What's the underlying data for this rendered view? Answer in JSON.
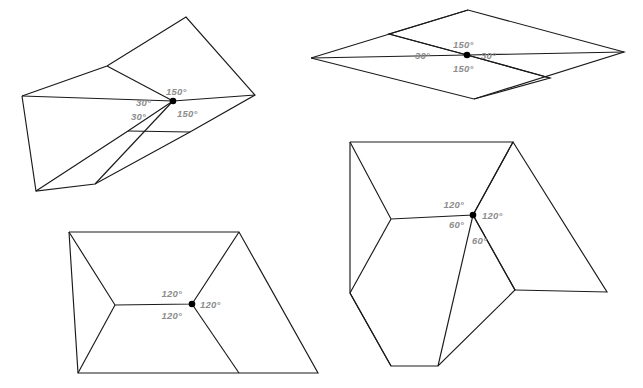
{
  "page": {
    "background_color": "#ffffff",
    "width": 643,
    "height": 388,
    "line_color": "#1a1a1a",
    "label_color": "#8d8d8d",
    "dot_color": "#000000"
  },
  "figures": [
    {
      "id": "figure-top-left",
      "name": "top-left-rhombus-tiling",
      "description": "Four rhombi meeting at a marked vertex, drawn as a folded zigzag band",
      "vertex": {
        "x": 173,
        "y": 101
      },
      "polylines": [
        "22,96 107,66 186,17 255,95 190,132 95,184 36,191 22,96",
        "22,96 173,101 255,95",
        "107,66 173,101",
        "95,184 173,101",
        "36,191 128,131 173,101",
        "190,132 128,131"
      ],
      "labels": [
        {
          "text": "150°",
          "x": 166,
          "y": 95,
          "anchor": "start",
          "name": "angle-label-150-top"
        },
        {
          "text": "30°",
          "x": 136,
          "y": 106,
          "anchor": "start",
          "name": "angle-label-30-left"
        },
        {
          "text": "30°",
          "x": 131,
          "y": 120,
          "anchor": "start",
          "name": "angle-label-30-lower-left"
        },
        {
          "text": "150°",
          "x": 177,
          "y": 117,
          "anchor": "start",
          "name": "angle-label-150-bottom"
        }
      ]
    },
    {
      "id": "figure-top-right",
      "name": "top-right-rhombus-grid",
      "description": "Large rhombus subdivided into four congruent smaller rhombi",
      "vertex": {
        "x": 467,
        "y": 55
      },
      "polylines": [
        "311,58 468,10 624,52 474,99 311,58",
        "311,58 467,55 624,52",
        "468,10 389,34 467,55 550,78 474,99",
        "389,34 467,55",
        "550,78 467,55"
      ],
      "labels": [
        {
          "text": "150°",
          "x": 453,
          "y": 48,
          "anchor": "start",
          "name": "angle-label-150-top"
        },
        {
          "text": "30°",
          "x": 430,
          "y": 59,
          "anchor": "end",
          "name": "angle-label-30-left"
        },
        {
          "text": "30°",
          "x": 481,
          "y": 59,
          "anchor": "start",
          "name": "angle-label-30-right"
        },
        {
          "text": "150°",
          "x": 453,
          "y": 72,
          "anchor": "start",
          "name": "angle-label-150-bottom"
        }
      ]
    },
    {
      "id": "figure-bottom-left",
      "name": "bottom-left-hexagon-parallelogram",
      "description": "Half hexagon and parallelogram meeting at a marked vertex with three 120 degree angles",
      "vertex": {
        "x": 192,
        "y": 304
      },
      "polylines": [
        "69,232 239,232 318,373 78,373 69,232",
        "69,232 115,305 192,304 239,232",
        "115,305 78,373",
        "192,304 239,373"
      ],
      "labels": [
        {
          "text": "120°",
          "x": 182,
          "y": 297,
          "anchor": "end",
          "name": "angle-label-120-upper"
        },
        {
          "text": "120°",
          "x": 200,
          "y": 308,
          "anchor": "start",
          "name": "angle-label-120-right"
        },
        {
          "text": "120°",
          "x": 182,
          "y": 319,
          "anchor": "end",
          "name": "angle-label-120-lower"
        }
      ]
    },
    {
      "id": "figure-bottom-right",
      "name": "bottom-right-hexagon-rhombi",
      "description": "Regular hexagon with two rhombi meeting at a marked vertex showing 120 and 60 degree angles",
      "vertex": {
        "x": 473,
        "y": 215
      },
      "polylines": [
        "350,142 513,142 473,215 515,290 438,366 391,366 350,293 350,142",
        "350,293 391,366",
        "350,142 391,219 473,215 513,142",
        "391,219 350,293",
        "473,215 438,366",
        "513,142 607,292 515,290",
        "473,215 515,290"
      ],
      "labels": [
        {
          "text": "120°",
          "x": 464,
          "y": 208,
          "anchor": "end",
          "name": "angle-label-120-upper-left"
        },
        {
          "text": "120°",
          "x": 482,
          "y": 219,
          "anchor": "start",
          "name": "angle-label-120-right"
        },
        {
          "text": "60°",
          "x": 464,
          "y": 228,
          "anchor": "end",
          "name": "angle-label-60-lower-left"
        },
        {
          "text": "60°",
          "x": 472,
          "y": 244,
          "anchor": "start",
          "name": "angle-label-60-below"
        }
      ]
    }
  ]
}
